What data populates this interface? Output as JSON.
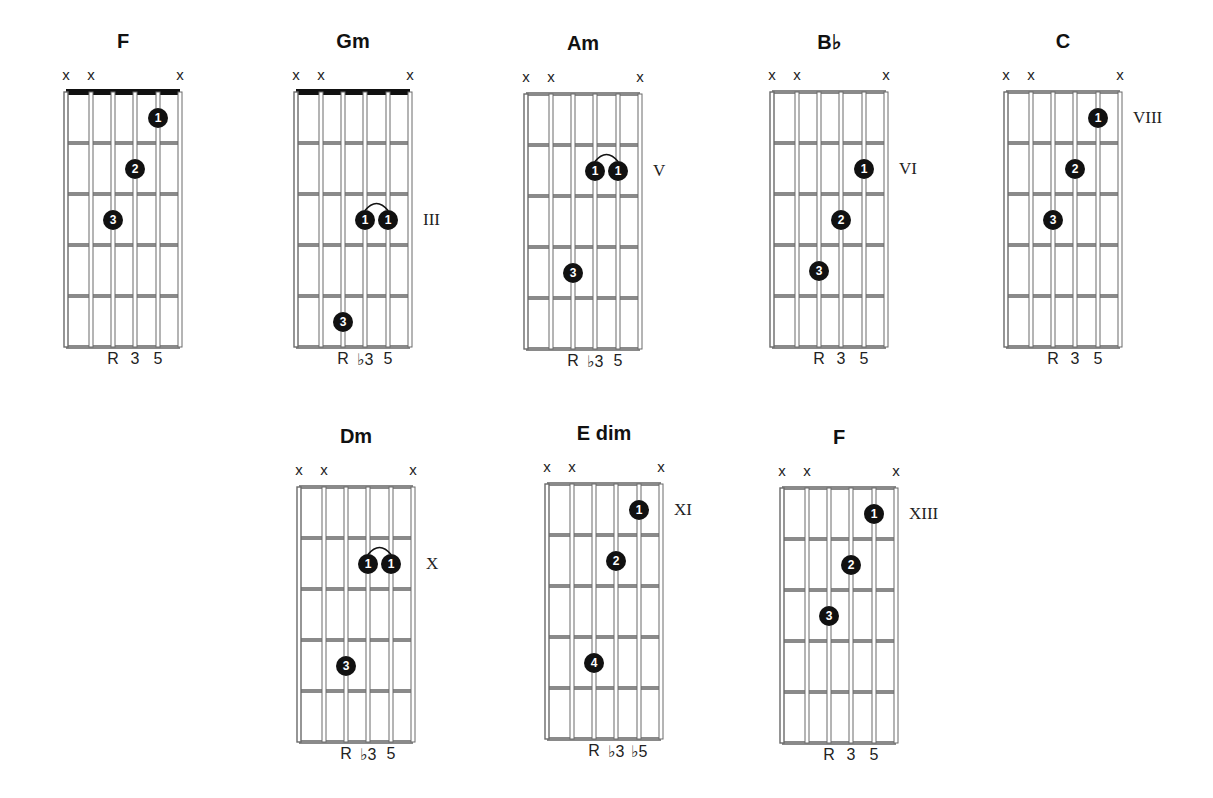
{
  "chart_data": {
    "type": "chord-diagrams",
    "title": "",
    "strings": 6,
    "frets_shown": 5,
    "chords": [
      {
        "name": "F",
        "muted": [
          1,
          2,
          6
        ],
        "nut": true,
        "position": "",
        "intervals": [
          "R",
          "3",
          "5"
        ],
        "fingers": [
          {
            "finger": "1",
            "string": 5,
            "fret": 1
          },
          {
            "finger": "2",
            "string": 4,
            "fret": 2
          },
          {
            "finger": "3",
            "string": 3,
            "fret": 3
          }
        ],
        "barre": false
      },
      {
        "name": "Gm",
        "muted": [
          1,
          2,
          6
        ],
        "nut": true,
        "position": "III",
        "intervals": [
          "R",
          "♭3",
          "5"
        ],
        "fingers": [
          {
            "finger": "1",
            "string": 4,
            "fret": 3
          },
          {
            "finger": "1",
            "string": 5,
            "fret": 3
          },
          {
            "finger": "3",
            "string": 3,
            "fret": 5
          }
        ],
        "barre": true
      },
      {
        "name": "Am",
        "muted": [
          1,
          2,
          6
        ],
        "nut": false,
        "position": "V",
        "intervals": [
          "R",
          "♭3",
          "5"
        ],
        "fingers": [
          {
            "finger": "1",
            "string": 4,
            "fret": 2
          },
          {
            "finger": "1",
            "string": 5,
            "fret": 2
          },
          {
            "finger": "3",
            "string": 3,
            "fret": 4
          }
        ],
        "barre": true
      },
      {
        "name": "B♭",
        "muted": [
          1,
          2,
          6
        ],
        "nut": false,
        "position": "VI",
        "intervals": [
          "R",
          "3",
          "5"
        ],
        "fingers": [
          {
            "finger": "1",
            "string": 5,
            "fret": 2
          },
          {
            "finger": "2",
            "string": 4,
            "fret": 3
          },
          {
            "finger": "3",
            "string": 3,
            "fret": 4
          }
        ],
        "barre": false
      },
      {
        "name": "C",
        "muted": [
          1,
          2,
          6
        ],
        "nut": false,
        "position": "VIII",
        "intervals": [
          "R",
          "3",
          "5"
        ],
        "fingers": [
          {
            "finger": "1",
            "string": 5,
            "fret": 1
          },
          {
            "finger": "2",
            "string": 4,
            "fret": 2
          },
          {
            "finger": "3",
            "string": 3,
            "fret": 3
          }
        ],
        "barre": false
      },
      {
        "name": "Dm",
        "muted": [
          1,
          2,
          6
        ],
        "nut": false,
        "position": "X",
        "intervals": [
          "R",
          "♭3",
          "5"
        ],
        "fingers": [
          {
            "finger": "1",
            "string": 4,
            "fret": 2
          },
          {
            "finger": "1",
            "string": 5,
            "fret": 2
          },
          {
            "finger": "3",
            "string": 3,
            "fret": 4
          }
        ],
        "barre": true
      },
      {
        "name": "E dim",
        "muted": [
          1,
          2,
          6
        ],
        "nut": false,
        "position": "XI",
        "intervals": [
          "R",
          "♭3",
          "♭5"
        ],
        "fingers": [
          {
            "finger": "1",
            "string": 5,
            "fret": 1
          },
          {
            "finger": "2",
            "string": 4,
            "fret": 2
          },
          {
            "finger": "4",
            "string": 3,
            "fret": 4
          }
        ],
        "barre": false
      },
      {
        "name": "F",
        "muted": [
          1,
          2,
          6
        ],
        "nut": false,
        "position": "XIII",
        "intervals": [
          "R",
          "3",
          "5"
        ],
        "fingers": [
          {
            "finger": "1",
            "string": 5,
            "fret": 1
          },
          {
            "finger": "2",
            "string": 4,
            "fret": 2
          },
          {
            "finger": "3",
            "string": 3,
            "fret": 3
          }
        ],
        "barre": false
      }
    ]
  },
  "chords": [
    {
      "name": "F",
      "mute": "x",
      "position": "",
      "intervals": [
        "R",
        "3",
        "5"
      ],
      "f1": "1",
      "f2": "2",
      "f3": "3"
    },
    {
      "name": "Gm",
      "mute": "x",
      "position": "III",
      "intervals": [
        "R",
        "♭3",
        "5"
      ],
      "f1": "1",
      "f2": "1",
      "f3": "3"
    },
    {
      "name": "Am",
      "mute": "x",
      "position": "V",
      "intervals": [
        "R",
        "♭3",
        "5"
      ],
      "f1": "1",
      "f2": "1",
      "f3": "3"
    },
    {
      "name": "B♭",
      "mute": "x",
      "position": "VI",
      "intervals": [
        "R",
        "3",
        "5"
      ],
      "f1": "1",
      "f2": "2",
      "f3": "3"
    },
    {
      "name": "C",
      "mute": "x",
      "position": "VIII",
      "intervals": [
        "R",
        "3",
        "5"
      ],
      "f1": "1",
      "f2": "2",
      "f3": "3"
    },
    {
      "name": "Dm",
      "mute": "x",
      "position": "X",
      "intervals": [
        "R",
        "♭3",
        "5"
      ],
      "f1": "1",
      "f2": "1",
      "f3": "3"
    },
    {
      "name": "E dim",
      "mute": "x",
      "position": "XI",
      "intervals": [
        "R",
        "♭3",
        "♭5"
      ],
      "f1": "1",
      "f2": "2",
      "f3": "4"
    },
    {
      "name": "F",
      "mute": "x",
      "position": "XIII",
      "intervals": [
        "R",
        "3",
        "5"
      ],
      "f1": "1",
      "f2": "2",
      "f3": "3"
    }
  ],
  "colors": {
    "ink": "#111111",
    "fret": "#8a8a8a",
    "background": "#ffffff"
  }
}
